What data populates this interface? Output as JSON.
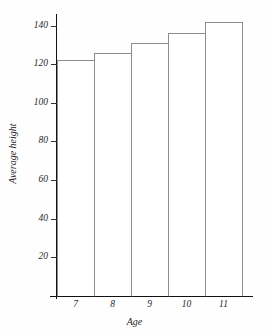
{
  "chart_data": {
    "type": "bar",
    "title": "",
    "xlabel": "Age",
    "ylabel": "Average height",
    "categories": [
      "7",
      "8",
      "9",
      "10",
      "11"
    ],
    "values": [
      122,
      126,
      131,
      136,
      142
    ],
    "series": [
      {
        "name": "Average height",
        "values": [
          122,
          126,
          131,
          136,
          142
        ]
      }
    ],
    "ylim": [
      0,
      146
    ],
    "xlim": [
      6.5,
      11.5
    ],
    "ytick_labels": [
      "20",
      "40",
      "60",
      "80",
      "100",
      "120",
      "140"
    ],
    "ytick_values": [
      20,
      40,
      60,
      80,
      100,
      120,
      140
    ],
    "xtick_labels": [
      "7",
      "8",
      "9",
      "10",
      "11"
    ],
    "grid": false,
    "legend": false,
    "legend_position": "none",
    "bar_style": "adjacent-outlined",
    "colors": {
      "bar_fill": "#ffffff",
      "bar_outline": "#8d8d8d",
      "axis": "#111111",
      "text": "#1f1f1f",
      "background": "#fefefe"
    }
  }
}
